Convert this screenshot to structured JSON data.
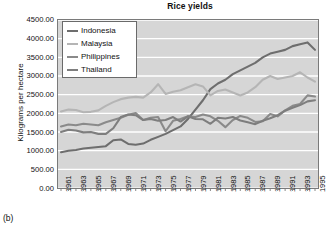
{
  "panel_label": "(b)",
  "axis": {
    "y_title": "Kilograms per hectare",
    "y_ticks": [
      "4500.00",
      "4000.00",
      "3500.00",
      "3000.00",
      "2500.00",
      "2000.00",
      "1500.00",
      "1000.00",
      "500.00",
      "0.00"
    ],
    "x_ticks": [
      "1961",
      "1963",
      "1965",
      "1967",
      "1969",
      "1971",
      "1973",
      "1975",
      "1977",
      "1979",
      "1981",
      "1983",
      "1985",
      "1987",
      "1989",
      "1991",
      "1993",
      "1995"
    ]
  },
  "colors": {
    "plot_background": "#d6d6d6",
    "gridline": "#ffffff",
    "frame": "#7a7a7a",
    "indonesia": "#6e6e6e",
    "malaysia": "#b5b5b5",
    "philippines": "#8a8a8a",
    "thailand": "#7e7e7e",
    "text": "#111111"
  },
  "chart_data": {
    "type": "line",
    "title": "Rice yields",
    "xlabel": "",
    "ylabel": "Kilograms per hectare",
    "ylim": [
      0,
      4500
    ],
    "ytick_step": 500,
    "xlim": [
      1961,
      1995
    ],
    "grid": true,
    "grid_orientation": "horizontal",
    "legend_position": "top-left-inside",
    "x": [
      1961,
      1962,
      1963,
      1964,
      1965,
      1966,
      1967,
      1968,
      1969,
      1970,
      1971,
      1972,
      1973,
      1974,
      1975,
      1976,
      1977,
      1978,
      1979,
      1980,
      1981,
      1982,
      1983,
      1984,
      1985,
      1986,
      1987,
      1988,
      1989,
      1990,
      1991,
      1992,
      1993,
      1994,
      1995
    ],
    "series": [
      {
        "name": "Indonesia",
        "color": "#6e6e6e",
        "values": [
          960,
          1000,
          1020,
          1060,
          1080,
          1100,
          1120,
          1280,
          1300,
          1180,
          1160,
          1190,
          1290,
          1370,
          1450,
          1550,
          1650,
          1850,
          2100,
          2350,
          2650,
          2800,
          2900,
          3050,
          3150,
          3250,
          3350,
          3500,
          3600,
          3650,
          3700,
          3800,
          3850,
          3900,
          3700
        ]
      },
      {
        "name": "Malaysia",
        "color": "#b5b5b5",
        "values": [
          2050,
          2100,
          2090,
          2030,
          2040,
          2080,
          2200,
          2300,
          2380,
          2420,
          2440,
          2420,
          2560,
          2780,
          2520,
          2580,
          2620,
          2700,
          2780,
          2720,
          2480,
          2600,
          2640,
          2560,
          2480,
          2560,
          2700,
          2900,
          3000,
          2920,
          2960,
          3000,
          3100,
          2960,
          2850
        ]
      },
      {
        "name": "Philippines",
        "color": "#8a8a8a",
        "values": [
          1650,
          1700,
          1680,
          1720,
          1700,
          1680,
          1760,
          1820,
          1880,
          1960,
          2010,
          1820,
          1880,
          1900,
          1520,
          1800,
          1850,
          1920,
          1900,
          1970,
          1920,
          1800,
          1630,
          1820,
          1930,
          1880,
          1770,
          1790,
          1980,
          1920,
          2080,
          2200,
          2250,
          2480,
          2450
        ]
      },
      {
        "name": "Thailand",
        "color": "#7e7e7e",
        "values": [
          1500,
          1560,
          1540,
          1490,
          1500,
          1450,
          1450,
          1600,
          1900,
          1970,
          1950,
          1820,
          1850,
          1800,
          1820,
          1900,
          1780,
          1920,
          1850,
          1840,
          1720,
          1880,
          1860,
          1900,
          1810,
          1760,
          1710,
          1800,
          1870,
          1950,
          2070,
          2150,
          2220,
          2320,
          2350
        ]
      }
    ]
  }
}
